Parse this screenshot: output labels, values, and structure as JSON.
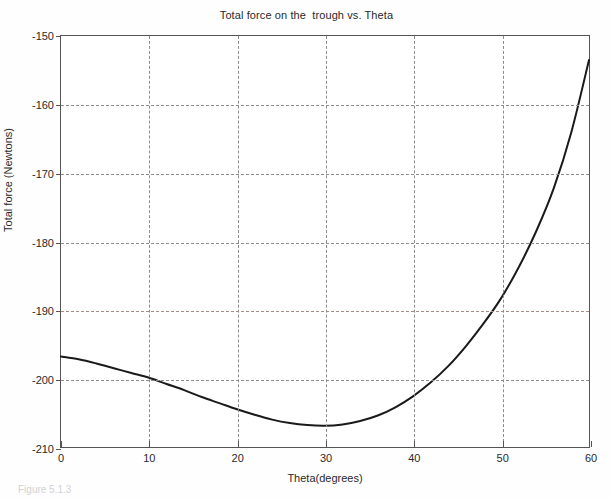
{
  "chart_data": {
    "type": "line",
    "title": "Total force on the  trough vs. Theta",
    "xlabel": "Theta(degrees)",
    "ylabel": "Total force (Newtons)",
    "xlim": [
      0,
      60
    ],
    "ylim": [
      -210,
      -150
    ],
    "xticks": [
      0,
      10,
      20,
      30,
      40,
      50,
      60
    ],
    "yticks": [
      -150,
      -160,
      -170,
      -180,
      -190,
      -200,
      -210
    ],
    "xtick_labels": [
      "0",
      "10",
      "20",
      "30",
      "40",
      "50",
      "60"
    ],
    "ytick_labels": [
      "-150",
      "-160",
      "-170",
      "-180",
      "-190",
      "-200",
      "-210"
    ],
    "grid": true,
    "grid_style": "dashed",
    "grid_color": "#8c8c8c",
    "legend": null,
    "series": [
      {
        "name": "Total force",
        "color": "#1a1a1a",
        "linewidth": 2,
        "x": [
          0,
          2,
          4,
          6,
          8,
          10,
          12,
          14,
          16,
          18,
          20,
          22,
          24,
          26,
          28,
          30,
          32,
          34,
          36,
          38,
          40,
          42,
          44,
          46,
          48,
          50,
          52,
          54,
          56,
          58,
          60
        ],
        "y": [
          -196.8,
          -197.2,
          -197.8,
          -198.5,
          -199.2,
          -199.9,
          -200.8,
          -201.7,
          -202.7,
          -203.6,
          -204.5,
          -205.3,
          -206.0,
          -206.5,
          -206.8,
          -206.9,
          -206.7,
          -206.2,
          -205.4,
          -204.2,
          -202.6,
          -200.6,
          -198.2,
          -195.3,
          -192.0,
          -188.3,
          -183.8,
          -178.5,
          -172.2,
          -164.0,
          -153.5
        ]
      }
    ],
    "annotations": []
  },
  "figure": {
    "caption": "Figure 5.1.3"
  }
}
